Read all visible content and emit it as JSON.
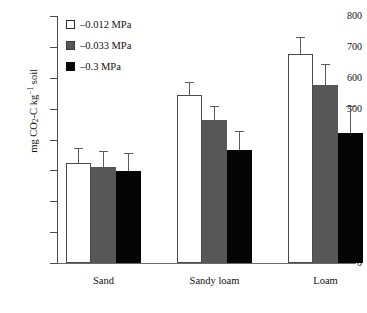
{
  "chart_data": {
    "type": "bar",
    "title": "",
    "xlabel": "",
    "ylabel": "mg CO2-C kg-1 soil",
    "ylabel_parts": {
      "prefix": "mg CO",
      "sub": "2",
      "mid": "-C kg",
      "sup": "−1",
      "suffix": " soil"
    },
    "categories": [
      "Sand",
      "Sandy loam",
      "Loam"
    ],
    "ylim": [
      0,
      800
    ],
    "yticks": [
      0,
      100,
      200,
      300,
      400,
      500,
      600,
      700,
      800
    ],
    "ytick_labels": [
      "0",
      "100",
      "200",
      "300",
      "400",
      "500",
      "600",
      "700",
      "800"
    ],
    "grid": false,
    "legend_position": "top-left",
    "series": [
      {
        "name": "–0.012 MPa",
        "color": "#ffffff",
        "values": [
          325,
          543,
          678
        ],
        "errors": [
          48,
          44,
          55
        ]
      },
      {
        "name": "–0.033 MPa",
        "color": "#575757",
        "values": [
          310,
          462,
          578
        ],
        "errors": [
          52,
          48,
          68
        ]
      },
      {
        "name": "–0.3 MPa",
        "color": "#050505",
        "values": [
          297,
          366,
          420
        ],
        "errors": [
          58,
          62,
          90
        ]
      }
    ]
  },
  "legend": {
    "items": [
      {
        "label": "–0.012 MPa",
        "swatch": "white"
      },
      {
        "label": "–0.033 MPa",
        "swatch": "gray"
      },
      {
        "label": "–0.3 MPa",
        "swatch": "black"
      }
    ]
  }
}
